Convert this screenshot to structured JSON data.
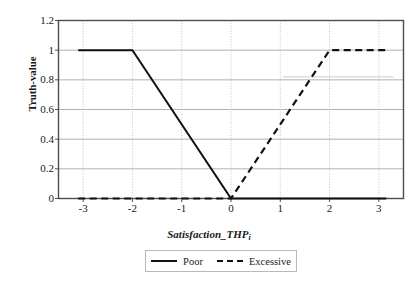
{
  "chart_data": {
    "type": "line",
    "title": "",
    "xlabel": "Satisfaction_THP",
    "xlabel_sub": "i",
    "ylabel": "Truth-value",
    "xlim": [
      -3.5,
      3.5
    ],
    "ylim": [
      0,
      1.2
    ],
    "xticks": [
      "-3",
      "-2",
      "-1",
      "0",
      "1",
      "2",
      "3"
    ],
    "xtick_values": [
      -3,
      -2,
      -1,
      0,
      1,
      2,
      3
    ],
    "yticks": [
      "0",
      "0.2",
      "0.4",
      "0.6",
      "0.8",
      "1",
      "1.2"
    ],
    "ytick_values": [
      0,
      0.2,
      0.4,
      0.6,
      0.8,
      1,
      1.2
    ],
    "grid": "both",
    "legend_position": "bottom-center",
    "series": [
      {
        "name": "Poor",
        "style": "solid",
        "color": "#111111",
        "x": [
          -3.1,
          -2,
          0,
          3.15
        ],
        "values": [
          1,
          1,
          0,
          0
        ]
      },
      {
        "name": "Excessive",
        "style": "dashed",
        "color": "#111111",
        "x": [
          -3.1,
          0,
          2,
          3.15
        ],
        "values": [
          0,
          0,
          1,
          1
        ]
      }
    ]
  },
  "colors": {
    "line": "#111111",
    "axis": "#4d4d4d",
    "grid_horizontal": "#a8a8a8",
    "grid_vertical": "#bdbdbd",
    "legend_border": "#b9b9b9",
    "background": "#ffffff"
  },
  "legend": {
    "items": [
      {
        "label": "Poor",
        "style": "solid"
      },
      {
        "label": "Excessive",
        "style": "dashed"
      }
    ]
  }
}
